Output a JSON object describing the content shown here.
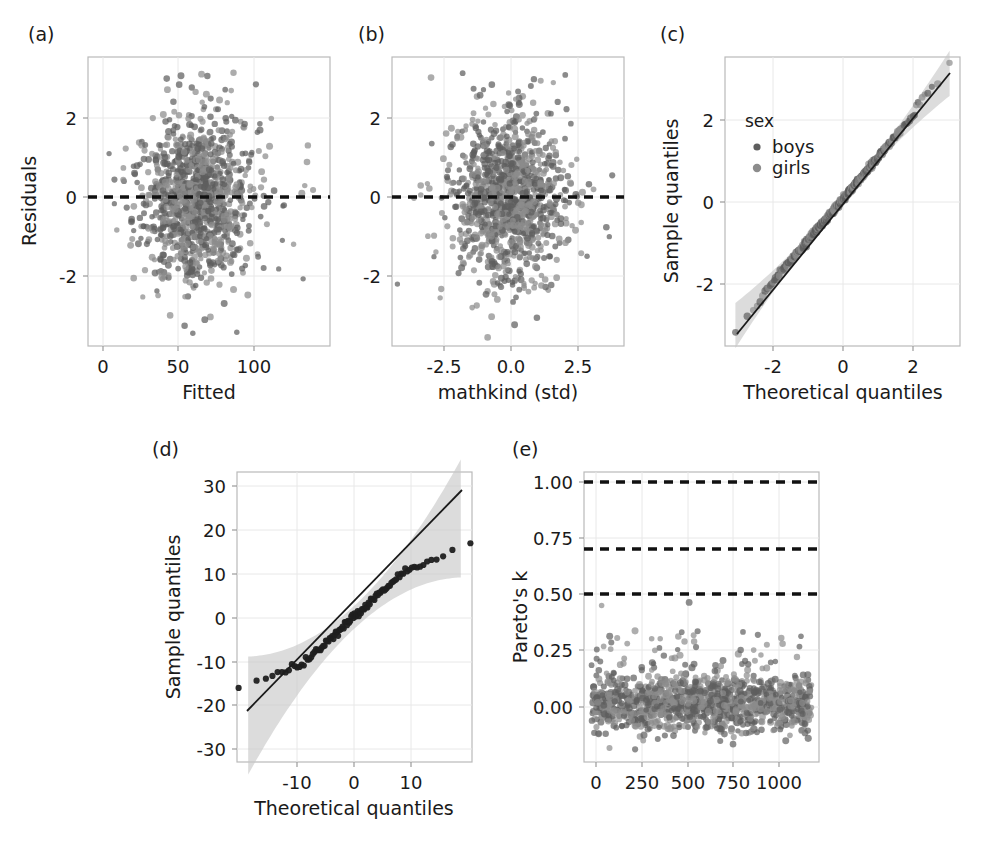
{
  "figure": {
    "width": 989,
    "height": 843,
    "background": "#ffffff",
    "point_color_boys": "#5e5e5e",
    "point_color_girls": "#8c8c8c",
    "point_color_dark": "#1f1f1f",
    "band_color": "#c6c6c6",
    "dash_color": "#111111",
    "grid_color": "#e8e8e8",
    "frame_color": "#b9b9b9"
  },
  "panels": {
    "a": {
      "letter": "(a)",
      "xlabel": "Fitted",
      "ylabel": "Residuals",
      "xticks": [
        "0",
        "50",
        "100"
      ],
      "yticks": [
        "2",
        "0",
        "-2"
      ]
    },
    "b": {
      "letter": "(b)",
      "xlabel": "mathkind (std)",
      "ylabel": "",
      "xticks": [
        "-2.5",
        "0.0",
        "2.5"
      ],
      "yticks": [
        "2",
        "0",
        "-2"
      ]
    },
    "c": {
      "letter": "(c)",
      "xlabel": "Theoretical quantiles",
      "ylabel": "Sample quantiles",
      "xticks": [
        "-2",
        "0",
        "2"
      ],
      "yticks": [
        "2",
        "0",
        "-2"
      ],
      "legend_title": "sex",
      "legend_items": [
        "boys",
        "girls"
      ]
    },
    "d": {
      "letter": "(d)",
      "xlabel": "Theoretical quantiles",
      "ylabel": "Sample quantiles",
      "xticks": [
        "-10",
        "0",
        "10"
      ],
      "yticks": [
        "30",
        "20",
        "10",
        "0",
        "-10",
        "-20",
        "-30"
      ]
    },
    "e": {
      "letter": "(e)",
      "xlabel": "",
      "ylabel": "Pareto's k",
      "xticks": [
        "0",
        "250",
        "500",
        "750",
        "1000"
      ],
      "yticks": [
        "1.00",
        "0.75",
        "0.50",
        "0.25",
        "0.00"
      ]
    }
  },
  "chart_data": [
    {
      "id": "a",
      "type": "scatter",
      "title": "(a)",
      "xlabel": "Fitted",
      "ylabel": "Residuals",
      "xlim": [
        -12,
        145
      ],
      "ylim": [
        -3.6,
        3.4
      ],
      "xticks": [
        0,
        50,
        100
      ],
      "yticks": [
        -2,
        0,
        2
      ],
      "grid": true,
      "reference_line": {
        "type": "hline",
        "y": 0,
        "style": "dashed"
      },
      "n_points": 1190,
      "note": "Residuals vs fitted values; cloud centered near fitted 30-90, residuals -3 to 3"
    },
    {
      "id": "b",
      "type": "scatter",
      "title": "(b)",
      "xlabel": "mathkind (std)",
      "ylabel": "",
      "xlim": [
        -4.3,
        4.3
      ],
      "ylim": [
        -3.6,
        3.4
      ],
      "xticks": [
        -2.5,
        0.0,
        2.5
      ],
      "yticks": [
        -2,
        0,
        2
      ],
      "grid": true,
      "reference_line": {
        "type": "hline",
        "y": 0,
        "style": "dashed"
      },
      "n_points": 1190,
      "note": "Residuals vs standardized mathkind predictor"
    },
    {
      "id": "c",
      "type": "scatter",
      "title": "(c)",
      "xlabel": "Theoretical quantiles",
      "ylabel": "Sample quantiles",
      "xlim": [
        -3.4,
        3.4
      ],
      "ylim": [
        -3.6,
        3.5
      ],
      "xticks": [
        -2,
        0,
        2
      ],
      "yticks": [
        -2,
        0,
        2
      ],
      "grid": true,
      "qq_line": {
        "slope": 1.0,
        "intercept": 0.0
      },
      "confidence_band": true,
      "legend": {
        "title": "sex",
        "entries": [
          "boys",
          "girls"
        ],
        "position": "upper-left"
      },
      "note": "Normal QQ plot of residuals by sex; points track the 45 degree line"
    },
    {
      "id": "d",
      "type": "scatter",
      "title": "(d)",
      "xlabel": "Theoretical quantiles",
      "ylabel": "Sample quantiles",
      "xlim": [
        -21,
        21
      ],
      "ylim": [
        -33,
        33
      ],
      "xticks": [
        -10,
        0,
        10
      ],
      "yticks": [
        -30,
        -20,
        -10,
        0,
        10,
        20,
        30
      ],
      "grid": true,
      "qq_line": {
        "slope": 1.18,
        "intercept": 0.0
      },
      "confidence_band": true,
      "note": "QQ plot of group-level random effects; mild S shape, tails inside band"
    },
    {
      "id": "e",
      "type": "scatter",
      "title": "(e)",
      "xlabel": "",
      "ylabel": "Pareto's k",
      "xlim": [
        -40,
        1220
      ],
      "ylim": [
        -0.17,
        1.09
      ],
      "xticks": [
        0,
        250,
        500,
        750,
        1000
      ],
      "yticks": [
        0.0,
        0.25,
        0.5,
        0.75,
        1.0
      ],
      "grid": true,
      "reference_lines": [
        {
          "y": 0.5,
          "style": "dashed"
        },
        {
          "y": 0.7,
          "style": "dashed"
        },
        {
          "y": 1.0,
          "style": "dashed"
        }
      ],
      "n_points": 1190,
      "value_range": [
        -0.12,
        0.55
      ],
      "note": "Pareto k diagnostics; nearly all values below 0.5 threshold, two near 0.53"
    }
  ]
}
